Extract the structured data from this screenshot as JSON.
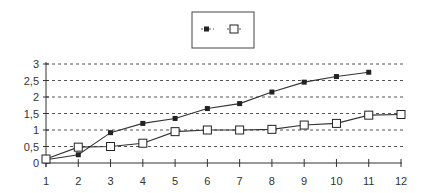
{
  "chart_data": {
    "type": "line",
    "title": "",
    "xlabel": "",
    "ylabel": "",
    "x": [
      1,
      2,
      3,
      4,
      5,
      6,
      7,
      8,
      9,
      10,
      11,
      12
    ],
    "x_tick_labels": [
      "1",
      "2",
      "3",
      "4",
      "5",
      "6",
      "7",
      "8",
      "9",
      "10",
      "11",
      "12"
    ],
    "y_tick_labels": [
      "0",
      "0,5",
      "1",
      "1,5",
      "2",
      "2,5",
      "3"
    ],
    "y_ticks": [
      0,
      0.5,
      1,
      1.5,
      2,
      2.5,
      3
    ],
    "ylim": [
      0,
      3
    ],
    "xlim": [
      1,
      12
    ],
    "grid": "horizontal dashed",
    "legend_position": "top-center",
    "series": [
      {
        "name": "",
        "marker": "filled-square",
        "values": [
          0.1,
          0.25,
          0.92,
          1.2,
          1.35,
          1.65,
          1.8,
          2.15,
          2.45,
          2.62,
          2.75,
          null
        ]
      },
      {
        "name": "",
        "marker": "hollow-square",
        "values": [
          0.12,
          0.48,
          0.5,
          0.6,
          0.95,
          1.0,
          1.0,
          1.02,
          1.15,
          1.2,
          1.45,
          1.47
        ]
      }
    ]
  },
  "colors": {
    "line": "#333333",
    "grid": "#555555",
    "background": "#ffffff"
  }
}
